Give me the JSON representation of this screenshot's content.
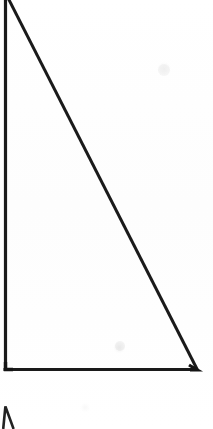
{
  "document": {
    "type": "scan",
    "background_color": "#fefefe",
    "width": 213,
    "height": 429,
    "caption": ""
  },
  "figure": {
    "name": "right-triangle",
    "stroke_color": "#1a1a1a",
    "stroke_width": 3,
    "fill": "none",
    "vertices": {
      "apex": {
        "x": 5,
        "y": -8
      },
      "bottom_left": {
        "x": 5,
        "y": 370
      },
      "bottom_right": {
        "x": 197,
        "y": 370
      }
    },
    "edges": [
      {
        "name": "left-leg-vertical",
        "from": "apex",
        "to": "bottom_left"
      },
      {
        "name": "bottom-leg-horizontal",
        "from": "bottom_left",
        "to": "bottom_right"
      },
      {
        "name": "hypotenuse",
        "from": "apex",
        "to": "bottom_right"
      }
    ],
    "labels": []
  },
  "artifacts": {
    "partial_mark": {
      "name": "cropped-caret-mark",
      "description": "Top tip of an adjacent figure, cropped by the bottom edge",
      "x": 2,
      "y": 404,
      "width": 14,
      "height": 25,
      "stroke_color": "#222222"
    },
    "smudges": [
      {
        "x": 120,
        "y": 346,
        "r": 5,
        "opacity": 0.16
      },
      {
        "x": 164,
        "y": 70,
        "r": 6,
        "opacity": 0.13
      }
    ]
  }
}
